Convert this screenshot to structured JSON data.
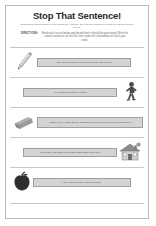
{
  "worksheet": {
    "title": "Stop That Sentence!",
    "subtitle": "Sometimes writers forget to end a sentence. Instead, they run the sentence on and on. This is called a run-on.",
    "directions_label": "DIRECTIONS:",
    "directions_text": "Read each run-on below and decide how it should be punctuated. Write the correct sentences on the line, then name the colored box to check your work.",
    "rows": [
      {
        "art": "pencil",
        "art_side": "left",
        "sentence": "Can I borrow one of your pencils mine has broken"
      },
      {
        "art": "running-person",
        "art_side": "right",
        "sentence": "Help Jess ran down my street"
      },
      {
        "art": "eraser",
        "art_side": "left",
        "sentence": "Where is my eraser an an I needed one for the test it is now so proud of it"
      },
      {
        "art": "house",
        "art_side": "right",
        "sentence": "My house is the third one on the right it has a new roof"
      },
      {
        "art": "apple",
        "art_side": "left",
        "sentence": "Hey I had an apple I do still hungry"
      }
    ]
  }
}
